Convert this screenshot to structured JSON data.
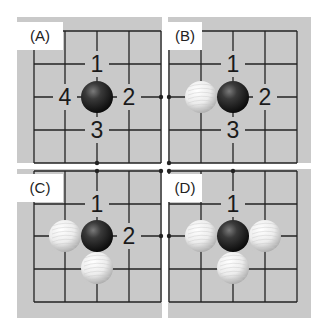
{
  "figure": {
    "width": 327,
    "height": 332,
    "background": "#ffffff",
    "board_color": "#c9c9c9",
    "line_color": "#222222",
    "label_box_color": "#ffffff",
    "number_color": "#1a1a1a",
    "cell": 32
  },
  "panels": [
    {
      "id": "A",
      "label": "(A)",
      "rect": [
        17,
        17,
        145,
        146
      ],
      "label_box": [
        17,
        22,
        46,
        28
      ],
      "grid_x": [
        34,
        65,
        97,
        129,
        161
      ],
      "grid_y": [
        31,
        64,
        97,
        130,
        163
      ],
      "open_right": true,
      "open_bottom": true,
      "dots": [
        [
          161,
          97
        ],
        [
          97,
          163
        ]
      ],
      "stones": [
        {
          "color": "black",
          "x": 97,
          "y": 97
        }
      ],
      "numbers": [
        {
          "text": "1",
          "x": 97,
          "y": 64
        },
        {
          "text": "2",
          "x": 129,
          "y": 97
        },
        {
          "text": "3",
          "x": 97,
          "y": 130
        },
        {
          "text": "4",
          "x": 65,
          "y": 97
        }
      ]
    },
    {
      "id": "B",
      "label": "(B)",
      "rect": [
        168,
        17,
        143,
        146
      ],
      "label_box": [
        168,
        22,
        34,
        28
      ],
      "grid_x": [
        169,
        201,
        233,
        265,
        297
      ],
      "grid_y": [
        31,
        64,
        97,
        130,
        163
      ],
      "open_left": true,
      "open_bottom": true,
      "dots": [
        [
          169,
          97
        ],
        [
          169,
          163
        ]
      ],
      "stones": [
        {
          "color": "white",
          "x": 201,
          "y": 97
        },
        {
          "color": "black",
          "x": 233,
          "y": 97
        }
      ],
      "numbers": [
        {
          "text": "1",
          "x": 233,
          "y": 64
        },
        {
          "text": "2",
          "x": 265,
          "y": 97
        },
        {
          "text": "3",
          "x": 233,
          "y": 130
        }
      ]
    },
    {
      "id": "C",
      "label": "(C)",
      "rect": [
        17,
        169,
        145,
        149
      ],
      "label_box": [
        17,
        174,
        46,
        28
      ],
      "grid_x": [
        34,
        65,
        97,
        129,
        161
      ],
      "grid_y": [
        171,
        204,
        236,
        269,
        302
      ],
      "open_right": true,
      "open_top": true,
      "dots": [
        [
          97,
          171
        ],
        [
          161,
          236
        ],
        [
          161,
          171
        ]
      ],
      "stones": [
        {
          "color": "white",
          "x": 65,
          "y": 236
        },
        {
          "color": "black",
          "x": 97,
          "y": 236
        },
        {
          "color": "white",
          "x": 97,
          "y": 268
        }
      ],
      "numbers": [
        {
          "text": "1",
          "x": 97,
          "y": 204
        },
        {
          "text": "2",
          "x": 129,
          "y": 236
        }
      ]
    },
    {
      "id": "D",
      "label": "(D)",
      "rect": [
        168,
        169,
        143,
        149
      ],
      "label_box": [
        168,
        174,
        34,
        28
      ],
      "grid_x": [
        169,
        201,
        233,
        265,
        297
      ],
      "grid_y": [
        171,
        204,
        236,
        269,
        302
      ],
      "open_left": true,
      "open_top": true,
      "dots": [
        [
          233,
          171
        ],
        [
          169,
          236
        ],
        [
          169,
          171
        ]
      ],
      "stones": [
        {
          "color": "white",
          "x": 201,
          "y": 236
        },
        {
          "color": "black",
          "x": 233,
          "y": 236
        },
        {
          "color": "white",
          "x": 265,
          "y": 236
        },
        {
          "color": "white",
          "x": 233,
          "y": 268
        }
      ],
      "numbers": [
        {
          "text": "1",
          "x": 233,
          "y": 204
        }
      ]
    }
  ]
}
